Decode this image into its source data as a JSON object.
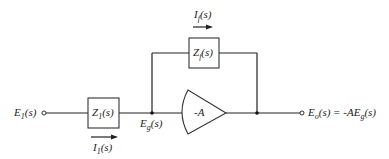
{
  "diagram": {
    "type": "inverting operational amplifier with impedances",
    "input": {
      "label": "E₁(s)"
    },
    "input_impedance": {
      "label": "Z₁(s)"
    },
    "input_current": {
      "label": "I₁(s)"
    },
    "summing_node": {
      "label": "E_g(s)"
    },
    "feedback_impedance": {
      "label": "Z_f(s)"
    },
    "feedback_current": {
      "label": "I_f(s)"
    },
    "amplifier": {
      "label": "-A"
    },
    "output": {
      "label": "Eₒ(s) = -AE_g(s)"
    }
  },
  "labels": {
    "e1": "E",
    "e1_sub": "1",
    "e1_arg": "(s)",
    "z1": "Z",
    "z1_sub": "1",
    "z1_arg": "(s)",
    "i1": "I",
    "i1_sub": "1",
    "i1_arg": "(s)",
    "eg": "E",
    "eg_sub": "g",
    "eg_arg": "(s)",
    "zf": "Z",
    "zf_sub": "f",
    "zf_arg": "(s)",
    "if": "I",
    "if_sub": "f",
    "if_arg": "(s)",
    "amp": "-A",
    "eo": "E",
    "eo_sub": "o",
    "eo_arg": "(s) = -AE",
    "eo_sub2": "g",
    "eo_arg2": "(s)"
  },
  "colors": {
    "line": "#222222",
    "background": "#ffffff"
  }
}
